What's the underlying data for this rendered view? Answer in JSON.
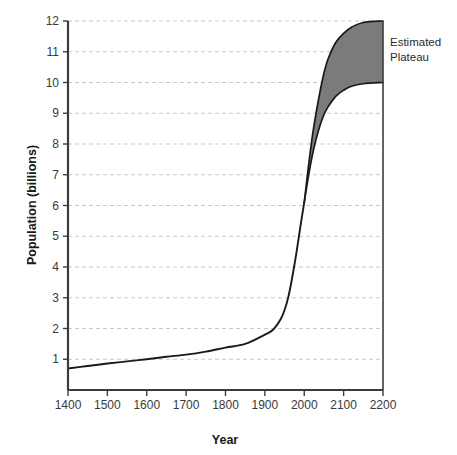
{
  "chart_data": {
    "type": "area",
    "title": "",
    "subtitle": "",
    "xlabel": "Year",
    "ylabel": "Population (billions)",
    "xlim": [
      1400,
      2200
    ],
    "ylim": [
      0,
      12
    ],
    "grid": true,
    "legend_position": "none",
    "x_ticks": [
      1400,
      1500,
      1600,
      1700,
      1800,
      1900,
      2000,
      2100,
      2200
    ],
    "x_tick_labels": [
      "1400",
      "1500",
      "1600",
      "1700",
      "1800",
      "1900",
      "2000",
      "2100",
      "2200"
    ],
    "y_ticks": [
      1,
      2,
      3,
      4,
      5,
      6,
      7,
      8,
      9,
      10,
      11,
      12
    ],
    "y_tick_labels": [
      "1",
      "2",
      "3",
      "4",
      "5",
      "6",
      "7",
      "8",
      "9",
      "10",
      "11",
      "12"
    ],
    "annotations": [
      {
        "name": "estimated-plateau-label",
        "lines": [
          "Estimated",
          "Plateau"
        ],
        "x": 2210,
        "y": 11.2
      }
    ],
    "colors": {
      "plateau_fill": "#7b7b7b",
      "curve_line": "#1a1a1a",
      "axis_line": "#3c3c3c",
      "gridline": "#c9c9c9",
      "background": "#ffffff"
    },
    "series": [
      {
        "name": "Historical population",
        "type": "line",
        "x": [
          1400,
          1450,
          1500,
          1550,
          1600,
          1650,
          1700,
          1750,
          1800,
          1850,
          1900,
          1920,
          1940,
          1950,
          1960,
          1970,
          1980,
          1990,
          2000
        ],
        "values": [
          0.7,
          0.78,
          0.86,
          0.93,
          1.0,
          1.08,
          1.15,
          1.25,
          1.38,
          1.5,
          1.8,
          1.95,
          2.3,
          2.6,
          3.05,
          3.7,
          4.45,
          5.3,
          6.1
        ]
      },
      {
        "name": "Estimated Plateau upper bound",
        "type": "line",
        "x": [
          2000,
          2010,
          2020,
          2030,
          2040,
          2050,
          2060,
          2080,
          2100,
          2120,
          2150,
          2200
        ],
        "values": [
          6.1,
          7.2,
          8.2,
          9.0,
          9.7,
          10.3,
          10.75,
          11.3,
          11.6,
          11.8,
          11.95,
          12.0
        ]
      },
      {
        "name": "Estimated Plateau lower bound",
        "type": "line",
        "x": [
          2000,
          2010,
          2020,
          2030,
          2040,
          2050,
          2060,
          2080,
          2100,
          2120,
          2150,
          2200
        ],
        "values": [
          6.1,
          6.9,
          7.6,
          8.15,
          8.6,
          8.95,
          9.2,
          9.55,
          9.75,
          9.88,
          9.96,
          10.0
        ]
      }
    ]
  }
}
